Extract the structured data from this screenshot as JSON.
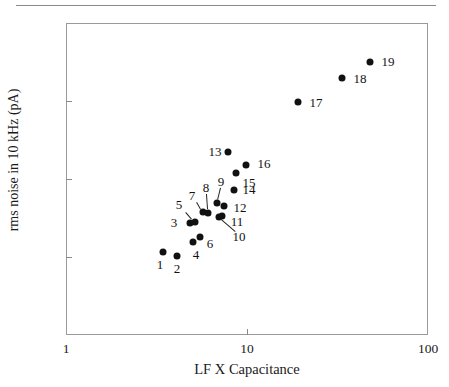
{
  "chart_data": {
    "type": "scatter",
    "title": "",
    "xlabel": "LF X Capacitance",
    "ylabel": "rms noise in 10 kHz (pA)",
    "xscale": "log",
    "yscale": "linear",
    "xlim": [
      1,
      100
    ],
    "ylim": [
      0.1,
      0.5
    ],
    "grid": false,
    "legend": "none",
    "xticks": [
      "1",
      "10",
      "100"
    ],
    "xtick_values": [
      1,
      10,
      100
    ],
    "yticks": [
      "0.10",
      "0.15",
      "0.20",
      "0.25",
      "0.30",
      "0.35",
      "0.40",
      "0.45",
      "0.50"
    ],
    "ytick_values": [
      0.1,
      0.15,
      0.2,
      0.25,
      0.3,
      0.35,
      0.4,
      0.45,
      0.5
    ],
    "ytick_marks_at": [
      0.2,
      0.3,
      0.4
    ],
    "xtick_marks_at": [
      10
    ],
    "marker_color": "#111111",
    "point_labels": [
      "1",
      "2",
      "3",
      "4",
      "5",
      "6",
      "7",
      "8",
      "9",
      "10",
      "11",
      "12",
      "13",
      "14",
      "15",
      "16",
      "17",
      "18",
      "19"
    ],
    "points": [
      {
        "label": "1",
        "x": 3.8,
        "y": 0.207,
        "px": 163,
        "py": 252,
        "lx": 160,
        "ly": 265,
        "leader": false
      },
      {
        "label": "2",
        "x": 4.3,
        "y": 0.202,
        "px": 177,
        "py": 256,
        "lx": 177,
        "ly": 269,
        "leader": false
      },
      {
        "label": "3",
        "x": 5.1,
        "y": 0.245,
        "px": 190,
        "py": 223,
        "lx": 174,
        "ly": 223,
        "leader": false
      },
      {
        "label": "4",
        "x": 5.3,
        "y": 0.22,
        "px": 193,
        "py": 242,
        "lx": 196,
        "ly": 255,
        "leader": false
      },
      {
        "label": "5",
        "x": 5.4,
        "y": 0.246,
        "px": 195,
        "py": 222,
        "lx": 179,
        "ly": 205,
        "leader": true,
        "ax": 186,
        "ay": 212,
        "bx": 192,
        "by": 219
      },
      {
        "label": "6",
        "x": 5.7,
        "y": 0.226,
        "px": 200,
        "py": 237,
        "lx": 210,
        "ly": 244,
        "leader": false
      },
      {
        "label": "7",
        "x": 5.9,
        "y": 0.259,
        "px": 203,
        "py": 212,
        "lx": 192,
        "ly": 196,
        "leader": true,
        "ax": 197,
        "ay": 202,
        "bx": 201,
        "by": 209
      },
      {
        "label": "8",
        "x": 6.2,
        "y": 0.258,
        "px": 208,
        "py": 213,
        "lx": 206,
        "ly": 188,
        "leader": true,
        "ax": 207,
        "ay": 194,
        "bx": 208,
        "by": 209
      },
      {
        "label": "9",
        "x": 6.8,
        "y": 0.271,
        "px": 217,
        "py": 203,
        "lx": 221,
        "ly": 182,
        "leader": true,
        "ax": 221,
        "ay": 188,
        "bx": 218,
        "by": 200
      },
      {
        "label": "10",
        "x": 6.9,
        "y": 0.251,
        "px": 219,
        "py": 217,
        "lx": 239,
        "ly": 237,
        "leader": true,
        "ax": 235,
        "ay": 232,
        "bx": 221,
        "by": 220
      },
      {
        "label": "11",
        "x": 7.1,
        "y": 0.253,
        "px": 222,
        "py": 216,
        "lx": 237,
        "ly": 222,
        "leader": false
      },
      {
        "label": "12",
        "x": 7.3,
        "y": 0.266,
        "px": 224,
        "py": 206,
        "lx": 240,
        "ly": 208,
        "leader": false
      },
      {
        "label": "13",
        "x": 8.0,
        "y": 0.332,
        "px": 228,
        "py": 152,
        "lx": 215,
        "ly": 152,
        "leader": false
      },
      {
        "label": "14",
        "x": 8.5,
        "y": 0.283,
        "px": 234,
        "py": 190,
        "lx": 249,
        "ly": 190,
        "leader": false
      },
      {
        "label": "15",
        "x": 8.7,
        "y": 0.305,
        "px": 236,
        "py": 173,
        "lx": 249,
        "ly": 183,
        "leader": false
      },
      {
        "label": "16",
        "x": 9.6,
        "y": 0.315,
        "px": 246,
        "py": 165,
        "lx": 264,
        "ly": 164,
        "leader": false
      },
      {
        "label": "17",
        "x": 18.3,
        "y": 0.399,
        "px": 298,
        "py": 102,
        "lx": 316,
        "ly": 103,
        "leader": false
      },
      {
        "label": "18",
        "x": 30.6,
        "y": 0.431,
        "px": 342,
        "py": 78,
        "lx": 360,
        "ly": 79,
        "leader": false
      },
      {
        "label": "19",
        "x": 45.3,
        "y": 0.45,
        "px": 370,
        "py": 62,
        "lx": 388,
        "ly": 62,
        "leader": false
      }
    ]
  }
}
